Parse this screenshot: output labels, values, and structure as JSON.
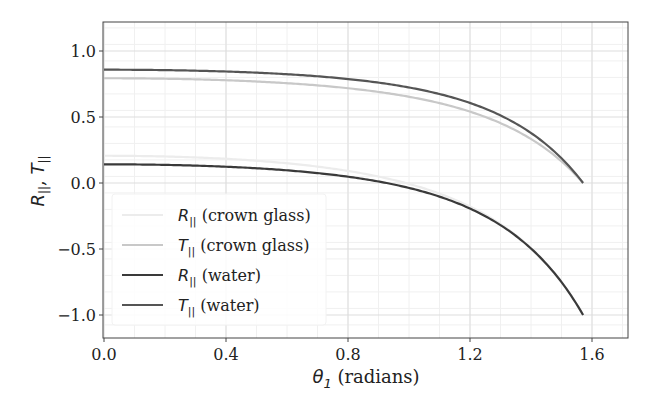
{
  "chart_data": {
    "type": "line",
    "title": "",
    "xlabel": "θ1 (radians)",
    "ylabel": "R||, T||",
    "xlim": [
      0.0,
      1.72
    ],
    "ylim": [
      -1.2,
      1.2
    ],
    "xticks": [
      0.0,
      0.4,
      0.8,
      1.2,
      1.6
    ],
    "xtick_labels": [
      "0.0",
      "0.4",
      "0.8",
      "1.2",
      "1.6"
    ],
    "yticks": [
      -1.0,
      -0.5,
      0.0,
      0.5,
      1.0
    ],
    "ytick_labels": [
      "−1.0",
      "−0.5",
      "0.0",
      "0.5",
      "1.0"
    ],
    "grid": true,
    "minor_grid": true,
    "legend_position": "lower left",
    "x": [
      0.0,
      0.2,
      0.4,
      0.6,
      0.8,
      1.0,
      1.1,
      1.2,
      1.3,
      1.4,
      1.45,
      1.5,
      1.55,
      1.5708
    ],
    "series": [
      {
        "name": "R|| (crown glass)",
        "color": "#ececec",
        "n": 1.52,
        "values": [
          0.206,
          0.204,
          0.196,
          0.18,
          0.15,
          0.097,
          0.055,
          -0.005,
          -0.098,
          -0.254,
          -0.372,
          -0.536,
          -0.793,
          -1.0
        ]
      },
      {
        "name": "T|| (crown glass)",
        "color": "#c8c8c8",
        "n": 1.52,
        "values": [
          0.794,
          0.792,
          0.787,
          0.776,
          0.757,
          0.722,
          0.694,
          0.654,
          0.594,
          0.494,
          0.413,
          0.305,
          0.136,
          0.0
        ]
      },
      {
        "name": "R|| (water)",
        "color": "#3a3a3a",
        "n": 1.33,
        "values": [
          0.142,
          0.14,
          0.133,
          0.12,
          0.096,
          0.052,
          0.018,
          -0.032,
          -0.112,
          -0.253,
          -0.362,
          -0.521,
          -0.784,
          -1.0
        ]
      },
      {
        "name": "T|| (water)",
        "color": "#555555",
        "n": 1.33,
        "values": [
          0.858,
          0.856,
          0.851,
          0.842,
          0.824,
          0.791,
          0.766,
          0.728,
          0.668,
          0.562,
          0.478,
          0.359,
          0.162,
          0.0
        ]
      }
    ]
  },
  "legend": {
    "items": [
      {
        "symbol": "R",
        "sub": "||",
        "label": " (crown glass)",
        "color": "#ececec"
      },
      {
        "symbol": "T",
        "sub": "||",
        "label": " (crown glass)",
        "color": "#c8c8c8"
      },
      {
        "symbol": "R",
        "sub": "||",
        "label": " (water)",
        "color": "#3a3a3a"
      },
      {
        "symbol": "T",
        "sub": "||",
        "label": " (water)",
        "color": "#555555"
      }
    ]
  },
  "axes": {
    "xlabel_symbol": "θ",
    "xlabel_sub": "1",
    "xlabel_rest": " (radians)",
    "ylabel_r": "R",
    "ylabel_t": "T",
    "ylabel_sub": "||",
    "ylabel_sep": ", "
  }
}
